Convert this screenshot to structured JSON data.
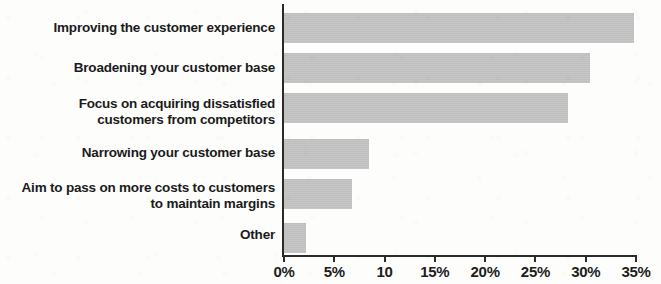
{
  "chart_data": {
    "type": "bar",
    "orientation": "horizontal",
    "title": "",
    "subtitle": "",
    "xlabel": "",
    "ylabel": "",
    "xlim": [
      0,
      35
    ],
    "grid": false,
    "legend": null,
    "bar_color": "#c2c2c2",
    "axis_color": "#2b2b2b",
    "text_color": "#1b1b1b",
    "categories": [
      "Improving the customer experience",
      "Broadening your customer base",
      "Focus on acquiring dissatisfied customers from competitors",
      "Narrowing your customer base",
      "Aim to pass on more costs to customers to maintain margins",
      "Other"
    ],
    "category_lines": [
      [
        "Improving the customer experience"
      ],
      [
        "Broadening your customer base"
      ],
      [
        "Focus on acquiring dissatisfied",
        "customers from competitors"
      ],
      [
        "Narrowing your customer base"
      ],
      [
        "Aim to pass on more costs to customers",
        "to maintain margins"
      ],
      [
        "Other"
      ]
    ],
    "values": [
      34.8,
      30.4,
      28.2,
      8.5,
      6.8,
      2.2
    ],
    "tick_values": [
      0,
      5,
      10,
      15,
      20,
      25,
      30,
      35
    ],
    "tick_labels": [
      "0%",
      "5%",
      "10",
      "15%",
      "20%",
      "25%",
      "30%",
      "35%"
    ]
  }
}
